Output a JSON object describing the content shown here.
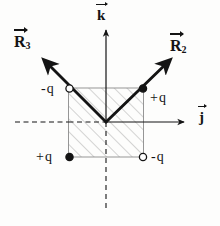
{
  "figure": {
    "background_color": "#fdfdfc",
    "ink_color": "#141414",
    "hatch_color": "#9a9a9a"
  },
  "axes": {
    "horizontal": {
      "label": "j",
      "label_symbol": "j",
      "has_overarrow": true,
      "style": "dashed-left-solid-right",
      "arrow_direction": "right"
    },
    "vertical": {
      "label": "k",
      "label_symbol": "k",
      "has_overarrow": true,
      "style": "solid-above-dashed-below",
      "arrow_direction": "up"
    },
    "origin_label": ""
  },
  "vectors": [
    {
      "name": "R",
      "subscript": "3",
      "label": "R",
      "direction": "upper-left",
      "has_overarrow": true
    },
    {
      "name": "R",
      "subscript": "2",
      "label": "R",
      "direction": "upper-right",
      "has_overarrow": true
    }
  ],
  "charges": [
    {
      "position": "top-left",
      "label": "-q",
      "sign": "negative",
      "marker": "open-circle"
    },
    {
      "position": "top-right",
      "label": "+q",
      "sign": "positive",
      "marker": "filled-circle"
    },
    {
      "position": "bottom-left",
      "label": "+q",
      "sign": "positive",
      "marker": "filled-circle"
    },
    {
      "position": "bottom-right",
      "label": "-q",
      "sign": "negative",
      "marker": "open-circle"
    }
  ],
  "region": {
    "shape": "square",
    "fill": "diagonal-hatching",
    "hatch_angle_degrees": 45
  }
}
